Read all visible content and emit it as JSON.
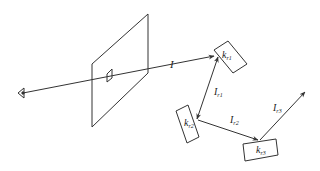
{
  "diagram": {
    "type": "ray-tracing-reflection",
    "colors": {
      "stroke": "#333333",
      "background": "#ffffff"
    },
    "elements": {
      "eye": {
        "label": ""
      },
      "image_plane": {
        "label": ""
      },
      "incident_ray": {
        "label": "I"
      },
      "surfaces": [
        {
          "id": "k_r1",
          "label_main": "k",
          "label_sub": "r1"
        },
        {
          "id": "k_r2",
          "label_main": "k",
          "label_sub": "r2"
        },
        {
          "id": "k_r3",
          "label_main": "k",
          "label_sub": "r3"
        }
      ],
      "reflected_rays": [
        {
          "id": "I_r1",
          "label_main": "I",
          "label_sub": "r1"
        },
        {
          "id": "I_r2",
          "label_main": "I",
          "label_sub": "r2"
        },
        {
          "id": "I_r3",
          "label_main": "I",
          "label_sub": "r3"
        }
      ]
    }
  }
}
